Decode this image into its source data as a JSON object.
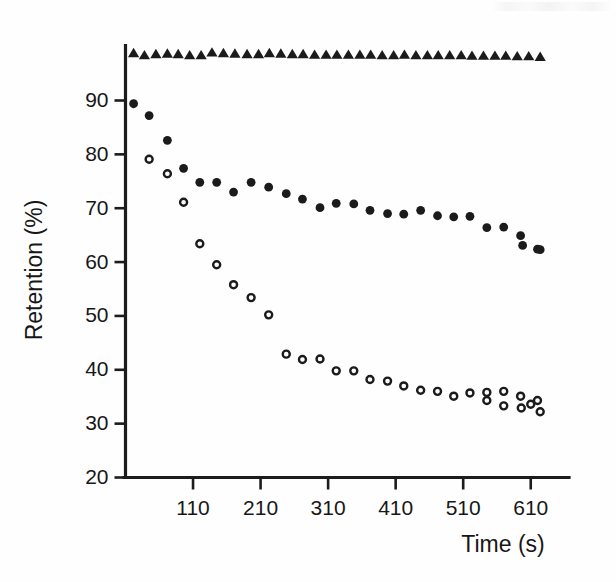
{
  "figure": {
    "width": 616,
    "height": 582,
    "background": "#fefefe",
    "ink_color": "#1b1b1b"
  },
  "axis_titles": {
    "x": "Time (s)",
    "y": "Retention (%)"
  },
  "chart_data": {
    "type": "scatter",
    "title": "",
    "subtitle": "",
    "xlabel": "Time (s)",
    "ylabel": "Retention (%)",
    "xlim": [
      10,
      640
    ],
    "ylim": [
      20,
      100
    ],
    "xticks": [
      110,
      210,
      310,
      410,
      510,
      610
    ],
    "xtick_labels": [
      "110",
      "210",
      "310",
      "410",
      "510",
      "610"
    ],
    "yticks": [
      20,
      30,
      40,
      50,
      60,
      70,
      80,
      90
    ],
    "ytick_labels": [
      "20",
      "30",
      "40",
      "50",
      "60",
      "70",
      "80",
      "90"
    ],
    "grid": false,
    "legend": "none",
    "legend_entries": [],
    "annotations": [],
    "series": [
      {
        "name": "series-triangles",
        "marker": "filled-triangle",
        "color": "#1b1b1b",
        "x": [
          22,
          38,
          55,
          72,
          88,
          105,
          122,
          138,
          155,
          172,
          190,
          207,
          223,
          240,
          257,
          273,
          290,
          307,
          323,
          340,
          357,
          373,
          390,
          407,
          423,
          440,
          457,
          473,
          490,
          507,
          523,
          540,
          557,
          573,
          590,
          607,
          624
        ],
        "y": [
          98.8,
          98.4,
          98.6,
          98.7,
          98.6,
          98.4,
          98.4,
          98.9,
          98.8,
          98.7,
          98.6,
          98.6,
          98.8,
          98.7,
          98.6,
          98.6,
          98.5,
          98.5,
          98.5,
          98.5,
          98.5,
          98.5,
          98.4,
          98.4,
          98.5,
          98.4,
          98.4,
          98.4,
          98.4,
          98.4,
          98.3,
          98.3,
          98.3,
          98.3,
          98.2,
          98.2,
          98.1
        ]
      },
      {
        "name": "series-filled-circles",
        "marker": "filled-circle",
        "color": "#1b1b1b",
        "x": [
          22,
          45,
          72,
          96,
          120,
          145,
          170,
          196,
          222,
          248,
          272,
          298,
          322,
          348,
          372,
          398,
          422,
          447,
          472,
          496,
          520,
          545,
          570,
          595,
          620
        ],
        "y": [
          89.4,
          87.2,
          82.6,
          77.4,
          74.8,
          74.8,
          73.0,
          74.8,
          73.9,
          72.7,
          71.7,
          70.1,
          70.9,
          70.8,
          69.6,
          69.0,
          68.9,
          69.6,
          68.6,
          68.4,
          68.5,
          66.4,
          66.5,
          64.9,
          62.4
        ]
      },
      {
        "name": "series-open-circles",
        "marker": "open-circle",
        "color": "#1b1b1b",
        "x": [
          45,
          72,
          96,
          120,
          145,
          170,
          196,
          222,
          248,
          272,
          298,
          322,
          348,
          372,
          398,
          422,
          447,
          472,
          496,
          520,
          545,
          570,
          595,
          620
        ],
        "y": [
          79.1,
          76.4,
          71.1,
          63.4,
          59.5,
          55.8,
          53.4,
          50.2,
          42.9,
          41.9,
          42.0,
          39.8,
          39.8,
          38.2,
          37.9,
          37.0,
          36.2,
          36.0,
          35.1,
          35.7,
          35.8,
          36.0,
          35.1,
          34.3
        ]
      },
      {
        "name": "series-filled-circles-tail",
        "marker": "filled-circle",
        "color": "#1b1b1b",
        "x": [
          598,
          624
        ],
        "y": [
          63.1,
          62.3
        ]
      },
      {
        "name": "series-open-circles-tail",
        "marker": "open-circle",
        "color": "#1b1b1b",
        "x": [
          545,
          570,
          596,
          610,
          624
        ],
        "y": [
          34.3,
          33.3,
          32.9,
          33.6,
          32.2
        ]
      }
    ]
  }
}
